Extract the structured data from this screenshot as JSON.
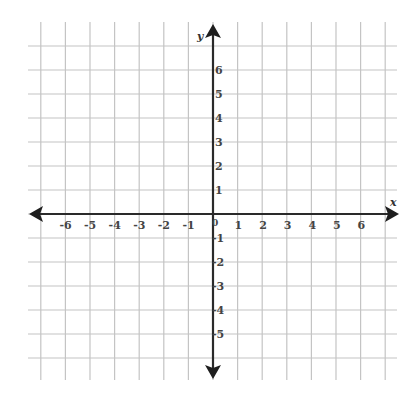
{
  "diagram": {
    "type": "coordinate-plane",
    "axes": {
      "x": {
        "label": "x",
        "min": -7,
        "max": 7,
        "tick_labels": [
          "-6",
          "-5",
          "-4",
          "-3",
          "-2",
          "-1",
          "1",
          "2",
          "3",
          "4",
          "5",
          "6"
        ]
      },
      "y": {
        "label": "y",
        "min": -6,
        "max": 7,
        "tick_labels": [
          "6",
          "5",
          "4",
          "3",
          "2",
          "1",
          "-1",
          "-2",
          "-3",
          "-4",
          "-5"
        ]
      },
      "origin_label": "0"
    },
    "grid": {
      "on": true,
      "spacing_units": 1
    },
    "colors": {
      "grid": "#c4c4c4",
      "axis": "#2a2a2a",
      "background": "#ffffff"
    }
  },
  "chart_data": {
    "type": "scatter",
    "title": "",
    "xlabel": "x",
    "ylabel": "y",
    "x_ticks": [
      -6,
      -5,
      -4,
      -3,
      -2,
      -1,
      0,
      1,
      2,
      3,
      4,
      5,
      6
    ],
    "y_ticks": [
      -5,
      -4,
      -3,
      -2,
      -1,
      0,
      1,
      2,
      3,
      4,
      5,
      6
    ],
    "xlim": [
      -7,
      7
    ],
    "ylim": [
      -6.5,
      7.5
    ],
    "grid": true,
    "series": []
  }
}
